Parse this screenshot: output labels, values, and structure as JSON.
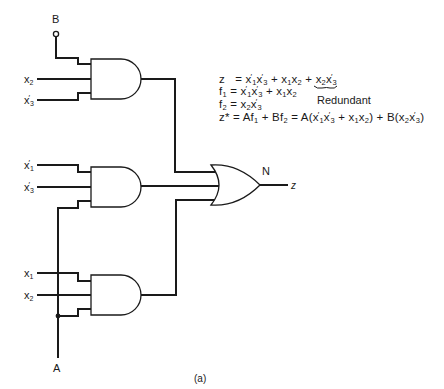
{
  "figure": {
    "caption": "(a)",
    "gate_or_name": "N",
    "output_label": "z",
    "control_inputs": {
      "top": "B",
      "bottom": "A"
    },
    "and_gates": [
      {
        "id": "and-top",
        "inputs": [
          "B",
          "x2",
          "x3'"
        ]
      },
      {
        "id": "and-middle",
        "inputs": [
          "x1'",
          "x3'",
          "A"
        ]
      },
      {
        "id": "and-bottom",
        "inputs": [
          "x1",
          "x2",
          "A"
        ]
      }
    ],
    "input_labels": {
      "g1_in2": {
        "base": "x",
        "sub": "2",
        "prime": false
      },
      "g1_in3": {
        "base": "x",
        "sub": "3",
        "prime": true
      },
      "g2_in1": {
        "base": "x",
        "sub": "1",
        "prime": true
      },
      "g2_in2": {
        "base": "x",
        "sub": "3",
        "prime": true
      },
      "g3_in1": {
        "base": "x",
        "sub": "1",
        "prime": false
      },
      "g3_in2": {
        "base": "x",
        "sub": "2",
        "prime": false
      }
    }
  },
  "equations": {
    "line1": "z  = x1'x3' + x1x2 + x2x3'",
    "line2": "f1 = x1'x3' + x1x2",
    "line3": "f2 = x2x3'",
    "line4": "z* = Af1 + Bf2 = A(x1'x3' + x1x2) + B(x2x3')",
    "annotation": "Redundant",
    "annotation_target": "x2x3'"
  },
  "text": {
    "B": "B",
    "A": "A",
    "N": "N",
    "z": "z",
    "caption": "(a)",
    "redundant": "Redundant",
    "x": "x",
    "s1": "1",
    "s2": "2",
    "s3": "3",
    "eq_z": "z",
    "eq_f": "f",
    "eq_zs": "z*",
    "eq_eq": " = ",
    "eq_plus": " + ",
    "eq_A": "A",
    "eq_B": "B",
    "eq_lp": "(",
    "eq_rp": ")"
  }
}
